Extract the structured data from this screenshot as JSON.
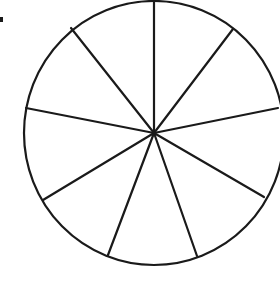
{
  "diagram": {
    "type": "circle divided into equal sectors",
    "sectors": 10,
    "stroke_color": "#1a1a1a",
    "background": "#ffffff",
    "center": [
      154,
      133
    ],
    "radius_x": 130,
    "radius_y": 132,
    "spoke_endpoints": [
      [
        154,
        1
      ],
      [
        233,
        29
      ],
      [
        278,
        108
      ],
      [
        264,
        197
      ],
      [
        197,
        256
      ],
      [
        108,
        255
      ],
      [
        43,
        200
      ],
      [
        26,
        108
      ],
      [
        71,
        28
      ]
    ],
    "marker_dot": [
      2,
      20
    ]
  }
}
